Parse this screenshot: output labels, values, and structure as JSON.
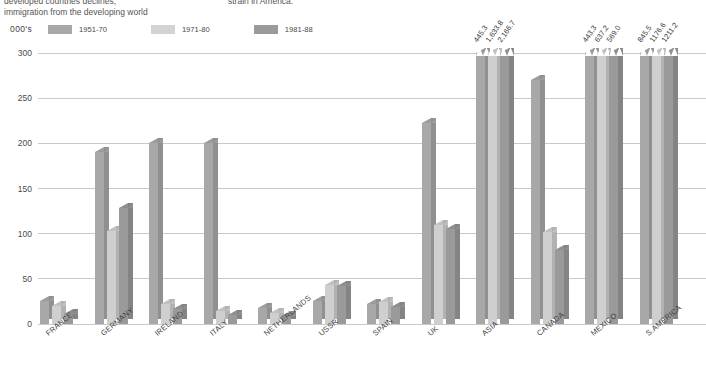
{
  "caption": {
    "left": "developed countries declines,\nimmigration from the developing world",
    "right": "strain in America."
  },
  "units_label": "000's",
  "legend": {
    "items": [
      {
        "label": "1951-70",
        "color": "#a8a8a8"
      },
      {
        "label": "1971-80",
        "color": "#cfcfcf"
      },
      {
        "label": "1981-88",
        "color": "#9a9a9a"
      }
    ]
  },
  "chart_data": {
    "type": "bar",
    "title": "",
    "xlabel": "",
    "ylabel": "000's",
    "ylim": [
      0,
      300
    ],
    "yticks": [
      0,
      50,
      100,
      150,
      200,
      250,
      300
    ],
    "ytick_labels": [
      "0",
      "50",
      "100",
      "150",
      "200",
      "250",
      "300"
    ],
    "grid": true,
    "legend_position": "top-left",
    "axis_break": true,
    "axis_break_note": "Bars exceeding 300 are clipped; true values shown as rotated labels above the break.",
    "categories": [
      "FRANCE",
      "GERMANY",
      "IRELAND",
      "ITALY",
      "NETHERLANDS",
      "USSR",
      "SPAIN",
      "UK",
      "ASIA",
      "CANADA",
      "MEXICO",
      "S.AMERICA"
    ],
    "series": [
      {
        "name": "1951-70",
        "color": "#a8a8a8",
        "values": [
          25.0,
          190.0,
          200.0,
          200.0,
          18.0,
          25.0,
          22.0,
          222.0,
          445.3,
          270.0,
          443.3,
          845.5
        ]
      },
      {
        "name": "1971-80",
        "color": "#cfcfcf",
        "values": [
          20.0,
          103.0,
          22.0,
          14.0,
          12.0,
          43.0,
          24.0,
          110.0,
          1633.8,
          102.0,
          637.2,
          1176.6
        ]
      },
      {
        "name": "1981-88",
        "color": "#9a9a9a",
        "values": [
          11.0,
          128.0,
          17.0,
          10.0,
          9.0,
          42.0,
          19.0,
          105.0,
          2166.7,
          82.0,
          569.0,
          1211.2
        ]
      }
    ],
    "overflow_labels": {
      "ASIA": [
        "445.3",
        "1,633.8",
        "2,166.7"
      ],
      "MEXICO": [
        "443.3",
        "637.2",
        "569.0"
      ],
      "S.AMERICA": [
        "845.5",
        "1176.6",
        "1211.2"
      ]
    }
  }
}
